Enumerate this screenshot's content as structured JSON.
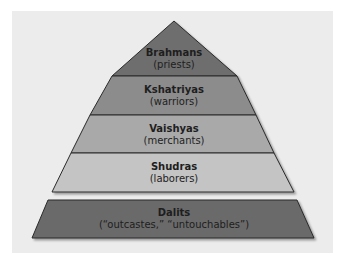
{
  "diagram": {
    "type": "pyramid",
    "colors": {
      "background_panel": "#ececec",
      "outline": "#2a2a2a",
      "text": "#1e1e1e"
    },
    "tiers": [
      {
        "name": "Brahmans",
        "role": "(priests)",
        "fill": "#6e6e6e"
      },
      {
        "name": "Kshatriyas",
        "role": "(warriors)",
        "fill": "#8c8c8c"
      },
      {
        "name": "Vaishyas",
        "role": "(merchants)",
        "fill": "#a9a9a9"
      },
      {
        "name": "Shudras",
        "role": "(laborers)",
        "fill": "#c4c4c4"
      }
    ],
    "base": {
      "name": "Dalits",
      "role": "(“outcastes,” “untouchables”)",
      "fill": "#6a6a6a"
    }
  }
}
